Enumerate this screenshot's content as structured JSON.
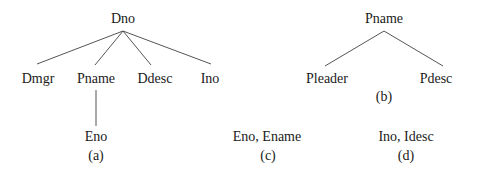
{
  "diagrams": {
    "a": {
      "caption": "(a)",
      "root": "Dno",
      "children": [
        "Dmgr",
        "Pname",
        "Ddesc",
        "Ino"
      ],
      "grandchild_of_pname": "Eno"
    },
    "b": {
      "caption": "(b)",
      "root": "Pname",
      "children": [
        "Pleader",
        "Pdesc"
      ]
    },
    "c": {
      "caption": "(c)",
      "label": "Eno, Ename"
    },
    "d": {
      "caption": "(d)",
      "label": "Ino, Idesc"
    }
  },
  "colors": {
    "line": "#555555",
    "text": "#1a1a1a",
    "background": "#ffffff"
  }
}
